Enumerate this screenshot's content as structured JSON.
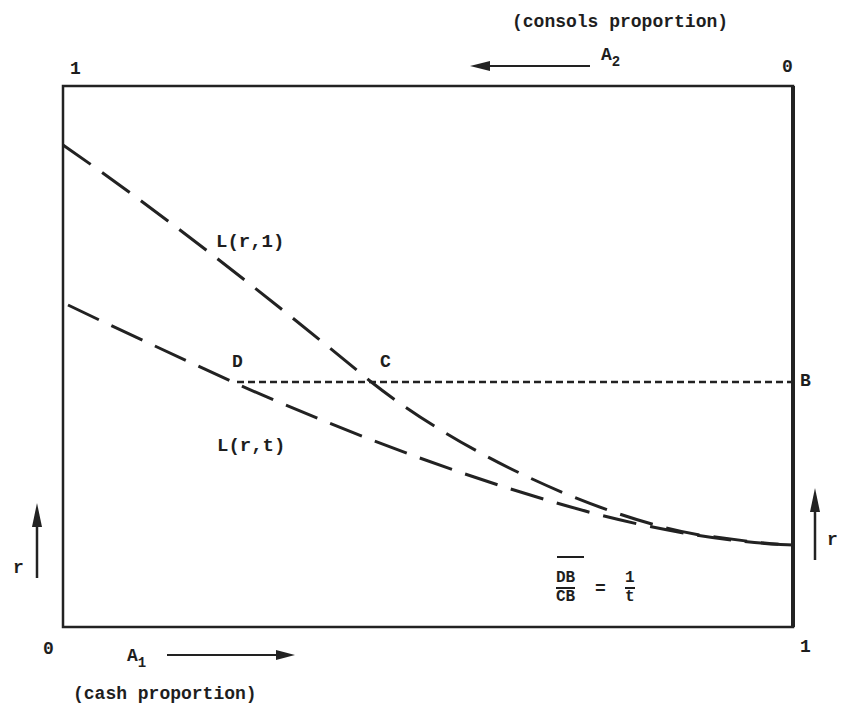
{
  "diagram": {
    "top_axis": {
      "caption": "(consols proportion)",
      "variable": "A",
      "variable_sub": "2",
      "left_tick": "1",
      "right_tick": "0",
      "arrow_direction": "left"
    },
    "bottom_axis": {
      "caption": "(cash proportion)",
      "variable": "A",
      "variable_sub": "1",
      "left_tick": "0",
      "right_tick": "1",
      "arrow_direction": "right"
    },
    "left_axis": {
      "label": "r",
      "arrow_direction": "up"
    },
    "right_axis": {
      "label": "r",
      "arrow_direction": "up"
    },
    "curves": [
      {
        "label": "L(r,1)",
        "style": "long-dash"
      },
      {
        "label": "L(r,t)",
        "style": "long-dash"
      }
    ],
    "points": {
      "D": "D",
      "C": "C",
      "B": "B"
    },
    "horizontal_line": {
      "from": "D",
      "to": "B",
      "style": "dotted"
    },
    "equation": {
      "numerator": "DB",
      "denominator": "CB",
      "equals": "=",
      "rhs_numerator": "1",
      "rhs_denominator": "t"
    }
  }
}
